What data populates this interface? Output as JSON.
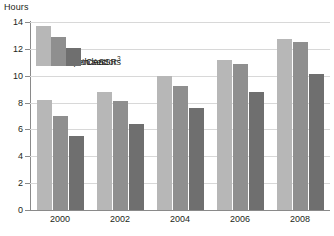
{
  "chart_data": {
    "type": "bar",
    "title": "",
    "subtitle": "",
    "xlabel": "",
    "ylabel": "Hours",
    "ylim": [
      0,
      14
    ],
    "ytick_step": 2,
    "grid": true,
    "legend_position": "top-left inside plot",
    "categories": [
      "2000",
      "2002",
      "2004",
      "2006",
      "2008"
    ],
    "yticks": [
      "0",
      "2",
      "4",
      "6",
      "8",
      "10",
      "12",
      "14"
    ],
    "series": [
      {
        "name": "Independent",
        "color": "#b7b7b7",
        "values": [
          8.2,
          8.8,
          10.0,
          11.2,
          12.7
        ]
      },
      {
        "name": "Both sectors",
        "color": "#8f8f8f",
        "values": [
          7.0,
          8.1,
          9.2,
          10.9,
          12.5
        ]
      },
      {
        "name": "CASSR",
        "name_display": "CASSR",
        "footnote_marker": "3",
        "color": "#6f6f6f",
        "values": [
          5.5,
          6.4,
          7.6,
          8.8,
          10.1
        ]
      }
    ]
  },
  "axes": {
    "y_unit_label": "Hours"
  },
  "legend": {
    "items": [
      {
        "label": "Independent",
        "marker": "3"
      },
      {
        "label": "Both sectors",
        "marker": ""
      },
      {
        "label": "CASSR",
        "marker": "3"
      }
    ]
  },
  "colors": {
    "independent": "#b7b7b7",
    "both_sectors": "#8f8f8f",
    "cassr": "#6f6f6f",
    "gridline": "#d8d8d8",
    "axis": "#8a8a8a",
    "text": "#231f20",
    "background": "#ffffff"
  }
}
